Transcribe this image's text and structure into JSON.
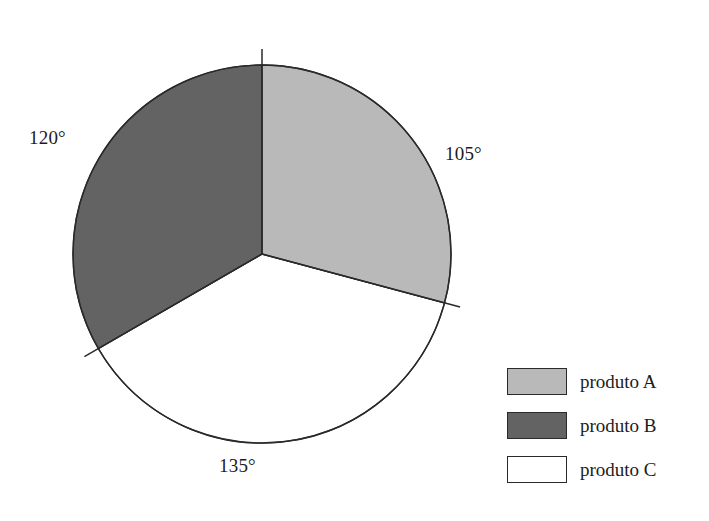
{
  "figure": {
    "background_color": "#ffffff",
    "outline_color": "#2a2a2a"
  },
  "chart_data": {
    "type": "pie",
    "title": "",
    "subtitle": "",
    "xlabel": "",
    "ylabel": "",
    "grid": false,
    "legend_position": "right",
    "center": {
      "x": 262,
      "y": 254
    },
    "radius": 189,
    "start_angle_deg": 0,
    "direction": "clockwise",
    "units": "degrees",
    "total_degrees": 360,
    "categories": [
      "produto A",
      "produto B",
      "produto C"
    ],
    "values": [
      105,
      120,
      135
    ],
    "value_labels": [
      "105°",
      "120°",
      "135°"
    ],
    "percentages": [
      29.2,
      33.3,
      37.5
    ],
    "colors": [
      "#b9b9b9",
      "#636363",
      "#ffffff"
    ],
    "slices": [
      {
        "label": "produto A",
        "angle_deg": 105,
        "angle_label": "105°",
        "color": "#b9b9b9",
        "start_deg": 0,
        "end_deg": 105,
        "label_x": 445,
        "label_y": 143
      },
      {
        "label": "produto B",
        "angle_deg": 120,
        "angle_label": "120°",
        "color": "#636363",
        "start_deg": 240,
        "end_deg": 360,
        "label_x": 29,
        "label_y": 127
      },
      {
        "label": "produto C",
        "angle_deg": 135,
        "angle_label": "135°",
        "color": "#ffffff",
        "start_deg": 105,
        "end_deg": 240,
        "label_x": 219,
        "label_y": 455
      }
    ]
  },
  "legend": {
    "items": [
      {
        "label": "produto A",
        "color": "#b9b9b9"
      },
      {
        "label": "produto B",
        "color": "#636363"
      },
      {
        "label": "produto C",
        "color": "#ffffff"
      }
    ]
  }
}
